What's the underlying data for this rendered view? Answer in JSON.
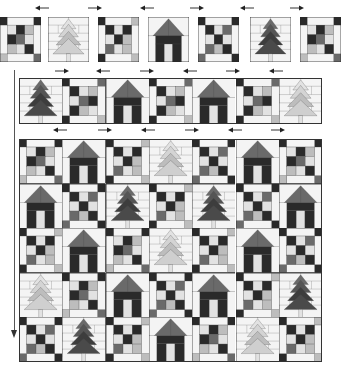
{
  "diagram": {
    "title": "",
    "colors": {
      "dark": "#2a2a2a",
      "mid": "#6a6a6a",
      "light": "#bdbdbd",
      "pale": "#e2e2e2",
      "white": "#f4f4f4",
      "line": "#444444"
    },
    "top_row": {
      "y": 17,
      "height": 45,
      "width": 41,
      "x_positions": [
        0,
        48,
        98,
        148,
        198,
        250,
        300
      ],
      "blocks": [
        "ninepatch-a",
        "tree-light",
        "ninepatch-b",
        "house",
        "ninepatch-c",
        "tree-dark",
        "ninepatch-a"
      ],
      "arrows": [
        {
          "x": 35,
          "y": 8,
          "dir": "left"
        },
        {
          "x": 88,
          "y": 8,
          "dir": "right"
        },
        {
          "x": 140,
          "y": 8,
          "dir": "left"
        },
        {
          "x": 190,
          "y": 8,
          "dir": "right"
        },
        {
          "x": 240,
          "y": 8,
          "dir": "left"
        },
        {
          "x": 290,
          "y": 8,
          "dir": "right"
        }
      ]
    },
    "second_row": {
      "y": 78,
      "height": 46,
      "x": 19,
      "block_width": 43.3,
      "blocks": [
        "tree-dark",
        "ninepatch-narrow",
        "house",
        "ninepatch-narrow",
        "house",
        "ninepatch-narrow",
        "tree-light"
      ],
      "arrows": [
        {
          "x": 55,
          "y": 71,
          "dir": "right"
        },
        {
          "x": 96,
          "y": 71,
          "dir": "left"
        },
        {
          "x": 140,
          "y": 71,
          "dir": "right"
        },
        {
          "x": 183,
          "y": 71,
          "dir": "left"
        },
        {
          "x": 226,
          "y": 71,
          "dir": "right"
        },
        {
          "x": 269,
          "y": 71,
          "dir": "left"
        }
      ]
    },
    "main_grid": {
      "x": 19,
      "y": 139,
      "cols": 7,
      "rows": 5,
      "block_width": 43.3,
      "block_height": 44.6,
      "rows_data": [
        [
          "ninepatch-a",
          "house",
          "ninepatch-b",
          "tree-light",
          "ninepatch-c",
          "house",
          "ninepatch-a"
        ],
        [
          "house",
          "ninepatch-c",
          "tree-dark",
          "ninepatch-b",
          "tree-dark",
          "ninepatch-c",
          "house"
        ],
        [
          "ninepatch-b",
          "house",
          "ninepatch-a",
          "tree-light",
          "ninepatch-b",
          "house",
          "ninepatch-c"
        ],
        [
          "tree-light",
          "ninepatch-a",
          "house",
          "ninepatch-c",
          "house",
          "ninepatch-b",
          "tree-dark"
        ],
        [
          "ninepatch-c",
          "tree-dark",
          "ninepatch-b",
          "house",
          "ninepatch-a",
          "tree-light",
          "ninepatch-b"
        ]
      ],
      "arrows": [
        {
          "x": 53,
          "y": 130,
          "dir": "left"
        },
        {
          "x": 98,
          "y": 130,
          "dir": "right"
        },
        {
          "x": 141,
          "y": 130,
          "dir": "left"
        },
        {
          "x": 185,
          "y": 130,
          "dir": "right"
        },
        {
          "x": 228,
          "y": 130,
          "dir": "left"
        },
        {
          "x": 271,
          "y": 130,
          "dir": "right"
        }
      ]
    },
    "assembly_arrow": {
      "direction": "down",
      "x": 14,
      "y_start": 70,
      "y_end": 338
    }
  }
}
